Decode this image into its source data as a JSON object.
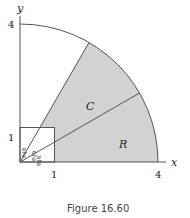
{
  "figure": {
    "caption": "Figure 16.60",
    "axes": {
      "x_label": "x",
      "y_label": "y"
    },
    "ticks": {
      "x": [
        "1",
        "4"
      ],
      "y": [
        "1",
        "4"
      ]
    },
    "regions": {
      "upper": "C",
      "lower": "R"
    },
    "angle_labels": [
      {
        "num": "π",
        "den": "6"
      },
      {
        "num": "π",
        "den": "6"
      },
      {
        "num": "π",
        "den": "6"
      }
    ],
    "colors": {
      "shade": "#d0d0d0",
      "stroke": "#555555",
      "text": "#222222"
    }
  }
}
